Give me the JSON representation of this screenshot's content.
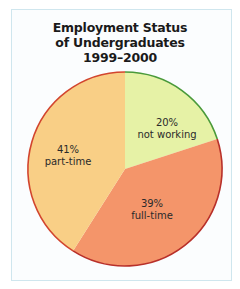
{
  "chart_data": {
    "type": "pie",
    "title": "Employment Status of Undergraduates 1999–2000",
    "title_lines": [
      "Employment Status",
      "of Undergraduates",
      "1999–2000"
    ],
    "categories": [
      "not working",
      "full-time",
      "part-time"
    ],
    "values": [
      20,
      39,
      41
    ],
    "unit": "%",
    "start_angle_deg": 0,
    "direction": "clockwise",
    "slices": [
      {
        "label": "not working",
        "value": 20,
        "display": "20%",
        "color": "#e6f2a6",
        "edge_color": "#4a9a3a"
      },
      {
        "label": "full-time",
        "value": 39,
        "display": "39%",
        "color": "#f4956a",
        "edge_color": "#b8302a"
      },
      {
        "label": "part-time",
        "value": 41,
        "display": "41%",
        "color": "#f9cf86",
        "edge_color": "#d2452e"
      }
    ],
    "legend": "none (labels inside slices)"
  },
  "labels": {
    "not_working": {
      "pct": "20%",
      "text": "not working"
    },
    "full_time": {
      "pct": "39%",
      "text": "full-time"
    },
    "part_time": {
      "pct": "41%",
      "text": "part-time"
    }
  },
  "colors": {
    "frame_border": "#cfe6ee",
    "frame_bg": "#fbfdfe"
  }
}
